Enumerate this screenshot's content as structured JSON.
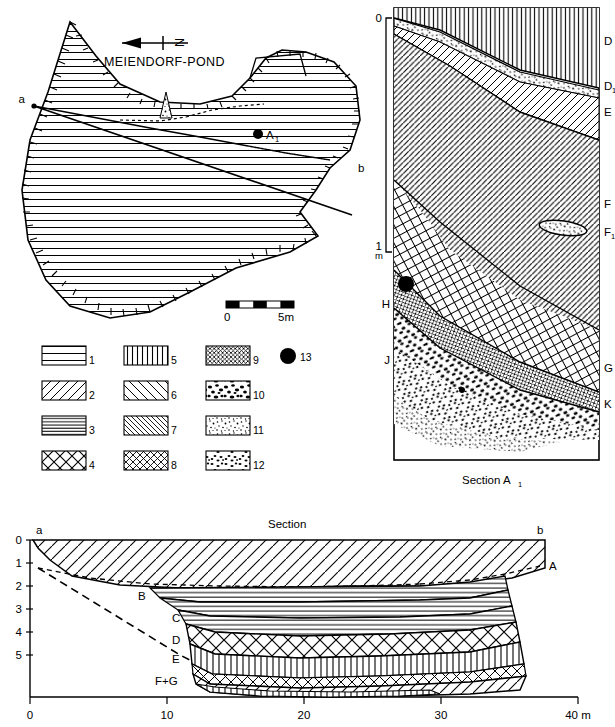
{
  "figure": {
    "map": {
      "title": "MEIENDORF-POND",
      "north_arrow_label": "N",
      "point_label": "A",
      "point_label_sub": "1",
      "section_end_a": "a",
      "section_end_b": "b",
      "scale_bar": {
        "start": "0",
        "end": "5m",
        "segments": 5
      }
    },
    "legend": {
      "items": [
        {
          "n": "1",
          "pattern": "horizontal-sparse"
        },
        {
          "n": "2",
          "pattern": "diagonal-forward-wide"
        },
        {
          "n": "3",
          "pattern": "horizontal-dense"
        },
        {
          "n": "4",
          "pattern": "cross-hatch-coarse"
        },
        {
          "n": "5",
          "pattern": "vertical-lines"
        },
        {
          "n": "6",
          "pattern": "diagonal-back-wide"
        },
        {
          "n": "7",
          "pattern": "diagonal-back-dense"
        },
        {
          "n": "8",
          "pattern": "cross-hatch-fine"
        },
        {
          "n": "9",
          "pattern": "cross-hatch-very-fine"
        },
        {
          "n": "10",
          "pattern": "stipple-coarse"
        },
        {
          "n": "11",
          "pattern": "stipple-fine"
        },
        {
          "n": "12",
          "pattern": "stipple-medium"
        },
        {
          "n": "13",
          "pattern": "filled-circle"
        }
      ]
    },
    "section_a1": {
      "caption": "Section A",
      "caption_sub": "1",
      "depth_scale": {
        "top": "0",
        "bottom": "1",
        "unit": "m"
      },
      "labels_right": [
        {
          "text": "D",
          "sub": ""
        },
        {
          "text": "D",
          "sub": "1"
        },
        {
          "text": "E",
          "sub": ""
        },
        {
          "text": "F",
          "sub": ""
        },
        {
          "text": "F",
          "sub": "1"
        },
        {
          "text": "G",
          "sub": ""
        },
        {
          "text": "K",
          "sub": ""
        }
      ],
      "labels_left": [
        {
          "text": "H",
          "sub": ""
        },
        {
          "text": "J",
          "sub": ""
        }
      ]
    },
    "section_ab": {
      "title": "Section",
      "end_left": "a",
      "end_right": "b",
      "y_axis": {
        "ticks": [
          "0",
          "1",
          "2",
          "3",
          "4",
          "5"
        ],
        "unit": "m"
      },
      "x_axis": {
        "ticks": [
          "0",
          "10",
          "20",
          "30",
          "40"
        ],
        "unit": "m",
        "last_label": "40 m"
      },
      "layer_labels": [
        {
          "text": "A"
        },
        {
          "text": "B"
        },
        {
          "text": "C"
        },
        {
          "text": "D"
        },
        {
          "text": "E"
        },
        {
          "text": "F+G"
        }
      ]
    }
  },
  "colors": {
    "ink": "#000000",
    "paper": "#ffffff"
  }
}
